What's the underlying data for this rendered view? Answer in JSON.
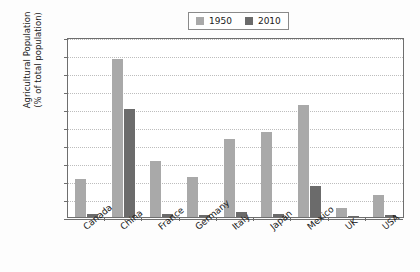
{
  "chart_data": {
    "type": "bar",
    "title": "",
    "xlabel": "",
    "ylabel": "Agricultural Population (% of total population)",
    "ylabel_line1": "Agricultural Population",
    "ylabel_line2": "(% of total population)",
    "ylim": [
      0,
      1
    ],
    "ytick_labels": [
      "1",
      "0.9",
      "0.8",
      "0.7",
      "0.6",
      "0.5",
      "0.4",
      "0.3",
      "0.2",
      "0.1",
      "0"
    ],
    "ytick_values": [
      1,
      0.9,
      0.8,
      0.7,
      0.6,
      0.5,
      0.4,
      0.3,
      0.2,
      0.1,
      0
    ],
    "grid": true,
    "legend_position": "top-center",
    "categories": [
      "Canada",
      "China",
      "France",
      "Germany",
      "Italy",
      "Japan",
      "Mexico",
      "UK",
      "USA"
    ],
    "series": [
      {
        "name": "1950",
        "color": "#a9a9a9",
        "values": [
          0.21,
          0.88,
          0.31,
          0.225,
          0.435,
          0.47,
          0.62,
          0.05,
          0.12
        ]
      },
      {
        "name": "2010",
        "color": "#6b6b6b",
        "values": [
          0.015,
          0.6,
          0.017,
          0.01,
          0.03,
          0.015,
          0.17,
          0.008,
          0.01
        ]
      }
    ]
  },
  "legend": {
    "entries": [
      {
        "label": "1950",
        "swatch": "legend-swatch-1950"
      },
      {
        "label": "2010",
        "swatch": "legend-swatch-2010"
      }
    ]
  },
  "colors": {
    "series_1950": "#a9a9a9",
    "series_2010": "#6b6b6b",
    "axis": "#6e6e6e",
    "gridline": "#bdbdbd",
    "text": "#1a1a1a",
    "plot_background": "#ffffff",
    "page_background": "#fdfdfd"
  }
}
